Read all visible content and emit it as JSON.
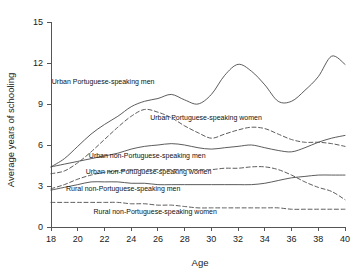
{
  "chart_data": {
    "type": "line",
    "title": "",
    "xlabel": "Age",
    "ylabel": "Average years of schooling",
    "xlim": [
      18,
      40
    ],
    "ylim": [
      0,
      15
    ],
    "xticks": [
      18,
      20,
      22,
      24,
      26,
      28,
      30,
      32,
      34,
      36,
      38,
      40
    ],
    "yticks": [
      0,
      3,
      6,
      9,
      12,
      15
    ],
    "grid": false,
    "legend_position": "inline-annotations",
    "x": [
      18,
      19,
      20,
      21,
      22,
      23,
      24,
      25,
      26,
      27,
      28,
      29,
      30,
      31,
      32,
      33,
      34,
      35,
      36,
      37,
      38,
      39,
      40
    ],
    "series": [
      {
        "name": "Urban Portuguese-speaking men",
        "style": "solid",
        "values": [
          4.4,
          5.0,
          5.9,
          6.8,
          7.5,
          8.1,
          8.8,
          9.2,
          9.4,
          9.7,
          9.3,
          9.0,
          9.7,
          11.1,
          11.9,
          11.4,
          10.4,
          9.2,
          9.2,
          10.0,
          11.0,
          12.5,
          11.9
        ]
      },
      {
        "name": "Urban Portuguese-speaking women",
        "style": "dashed",
        "values": [
          3.9,
          4.1,
          4.7,
          5.5,
          6.4,
          7.3,
          8.1,
          8.6,
          8.4,
          8.0,
          7.4,
          6.9,
          6.5,
          6.8,
          7.1,
          7.3,
          7.2,
          6.8,
          6.4,
          6.2,
          6.2,
          6.1,
          5.9
        ]
      },
      {
        "name": "Urban non-Portuguese-speaking men",
        "style": "solid",
        "values": [
          4.4,
          4.6,
          4.8,
          5.0,
          5.2,
          5.4,
          5.7,
          5.9,
          6.0,
          6.1,
          6.0,
          5.8,
          5.7,
          5.8,
          5.9,
          6.0,
          5.8,
          5.6,
          5.5,
          5.8,
          6.2,
          6.5,
          6.7
        ]
      },
      {
        "name": "Urban non-Portuguese-speaking women",
        "style": "dashed",
        "values": [
          2.8,
          3.1,
          3.5,
          3.8,
          4.0,
          4.1,
          4.2,
          4.2,
          4.2,
          4.2,
          4.2,
          4.2,
          4.2,
          4.3,
          4.3,
          4.4,
          4.4,
          4.2,
          3.8,
          3.3,
          2.9,
          2.6,
          2.0
        ]
      },
      {
        "name": "Rural non-Portuguese-speaking men",
        "style": "solid",
        "values": [
          2.7,
          2.9,
          3.1,
          3.3,
          3.3,
          3.3,
          3.2,
          3.2,
          3.1,
          3.1,
          3.1,
          3.1,
          3.1,
          3.1,
          3.1,
          3.1,
          3.2,
          3.4,
          3.6,
          3.7,
          3.8,
          3.8,
          3.8
        ]
      },
      {
        "name": "Rural non-Portuguese-speaking women",
        "style": "dashed",
        "values": [
          1.8,
          1.8,
          1.8,
          1.8,
          1.8,
          1.8,
          1.7,
          1.7,
          1.6,
          1.6,
          1.5,
          1.4,
          1.4,
          1.4,
          1.4,
          1.4,
          1.4,
          1.4,
          1.3,
          1.3,
          1.3,
          1.3,
          1.3
        ]
      }
    ],
    "annotations": [
      {
        "text": "Urban Portuguese-speaking men",
        "x": 21.9,
        "y": 10.5
      },
      {
        "text": "Urban Portuguese-speaking women",
        "x": 29.6,
        "y": 7.85
      },
      {
        "text": "Urban non-Portuguese-speaking men",
        "x": 25.2,
        "y": 5.05
      },
      {
        "text": "Urban non-Portuguese-speaking women",
        "x": 25.3,
        "y": 3.85
      },
      {
        "text": "Rural non-Portuguese-speaking men",
        "x": 23.4,
        "y": 2.65
      },
      {
        "text": "Rural non-Portuguese-speaking women",
        "x": 25.8,
        "y": 0.95
      }
    ]
  }
}
